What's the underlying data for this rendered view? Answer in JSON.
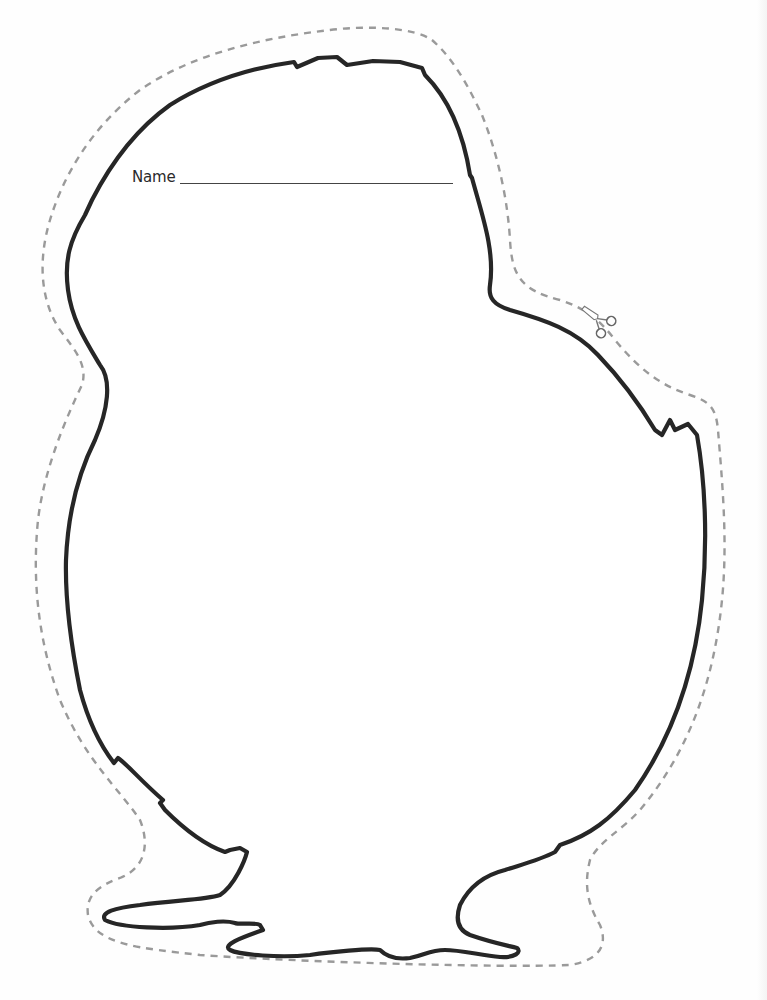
{
  "worksheet": {
    "type": "chick cut-out template",
    "name_field": {
      "label": "Name",
      "value": ""
    },
    "icons": {
      "scissors": "scissors-icon"
    },
    "colors": {
      "outline": "#222222",
      "cut_line": "#9a9a9a",
      "background": "#fefefe"
    }
  }
}
